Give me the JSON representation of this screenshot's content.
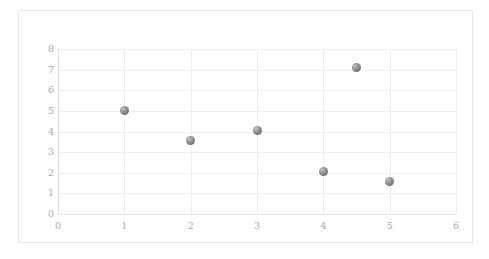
{
  "chart_data": {
    "type": "scatter",
    "title": "",
    "subtitle": "",
    "xlabel": "",
    "ylabel": "",
    "xlim": [
      0,
      6
    ],
    "ylim": [
      0,
      8
    ],
    "x_ticks": [
      0,
      1,
      2,
      3,
      4,
      5,
      6
    ],
    "y_ticks": [
      0,
      1,
      2,
      3,
      4,
      5,
      6,
      7,
      8
    ],
    "x_tick_labels": [
      "0",
      "1",
      "2",
      "3",
      "4",
      "5",
      "6"
    ],
    "y_tick_labels": [
      "0",
      "1",
      "2",
      "3",
      "4",
      "5",
      "6",
      "7",
      "8"
    ],
    "grid": true,
    "grid_axes": "both",
    "legend": false,
    "legend_position": "none",
    "marker": {
      "shape": "circle",
      "color": "#7c7c7c",
      "highlight_color": "#c2c2c2",
      "size_px": 9
    },
    "series": [
      {
        "name": "Series 1",
        "points": [
          {
            "x": 1,
            "y": 5.0
          },
          {
            "x": 2,
            "y": 3.55
          },
          {
            "x": 3,
            "y": 4.05
          },
          {
            "x": 4,
            "y": 2.05
          },
          {
            "x": 4.5,
            "y": 7.1
          },
          {
            "x": 5,
            "y": 1.6
          }
        ]
      }
    ],
    "colors": {
      "background": "#ffffff",
      "border": "#e9e9e9",
      "gridline": "#ededed",
      "axis": "#e0e0e0",
      "tick_label": "#a8a8a8"
    }
  }
}
